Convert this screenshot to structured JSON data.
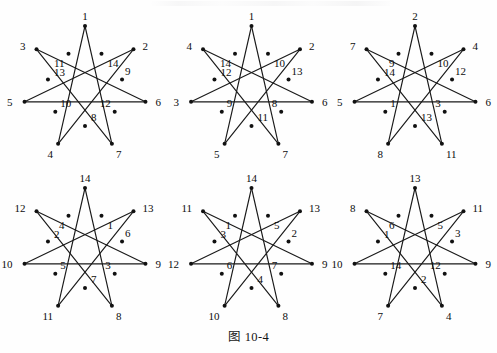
{
  "caption": "图 10-4",
  "figure_type": "seven-pointed-star-polygon-labelings",
  "colors": {
    "ink": "#1a1a1a",
    "node": "#111111",
    "label": "#0d0d0d",
    "page": "#fefefe"
  },
  "geometry": {
    "outer_radius": 62,
    "inner_radius": 38,
    "center_x": 84,
    "center_y": 82,
    "outer_count": 7,
    "inner_count": 7,
    "note": "Outer vertices at angles -90,-38.57,12.86,64.29,115.71,167.14,218.57 degrees; inner vertices midway between adjacent outer vertices."
  },
  "figures": [
    {
      "id": "figure-1",
      "position": "top-left",
      "outer_labels": [
        "1",
        "2",
        "6",
        "7",
        "4",
        "5",
        "3"
      ],
      "inner_labels": [
        "14",
        "9",
        "12",
        "8",
        "10",
        "13",
        "11"
      ]
    },
    {
      "id": "figure-2",
      "position": "top-center",
      "outer_labels": [
        "1",
        "2",
        "6",
        "7",
        "5",
        "3",
        "4"
      ],
      "inner_labels": [
        "10",
        "13",
        "8",
        "11",
        "9",
        "12",
        "14"
      ]
    },
    {
      "id": "figure-3",
      "position": "top-right",
      "outer_labels": [
        "2",
        "4",
        "6",
        "11",
        "8",
        "5",
        "7"
      ],
      "inner_labels": [
        "10",
        "12",
        "3",
        "13",
        "1",
        "14",
        "9"
      ]
    },
    {
      "id": "figure-4",
      "position": "bottom-left",
      "outer_labels": [
        "14",
        "13",
        "9",
        "8",
        "11",
        "10",
        "12"
      ],
      "inner_labels": [
        "1",
        "6",
        "3",
        "7",
        "5",
        "2",
        "4"
      ]
    },
    {
      "id": "figure-5",
      "position": "bottom-center",
      "outer_labels": [
        "14",
        "13",
        "9",
        "8",
        "10",
        "12",
        "11"
      ],
      "inner_labels": [
        "5",
        "2",
        "7",
        "4",
        "6",
        "3",
        "1"
      ]
    },
    {
      "id": "figure-6",
      "position": "bottom-right",
      "outer_labels": [
        "13",
        "11",
        "9",
        "4",
        "7",
        "10",
        "8"
      ],
      "inner_labels": [
        "5",
        "3",
        "12",
        "2",
        "14",
        "1",
        "6"
      ]
    }
  ],
  "label_offsets": {
    "outer": [
      {
        "dx": 0,
        "dy": -6
      },
      {
        "dx": 9,
        "dy": 1
      },
      {
        "dx": 10,
        "dy": 4
      },
      {
        "dx": 4,
        "dy": 14
      },
      {
        "dx": -5,
        "dy": 14
      },
      {
        "dx": -12,
        "dy": 4
      },
      {
        "dx": -11,
        "dy": 1
      }
    ],
    "inner": [
      {
        "dx": 6,
        "dy": 13
      },
      {
        "dx": 3,
        "dy": -5
      },
      {
        "dx": -4,
        "dy": -5
      },
      {
        "dx": 6,
        "dy": -5
      },
      {
        "dx": 5,
        "dy": -5
      },
      {
        "dx": 6,
        "dy": -4
      },
      {
        "dx": -4,
        "dy": 13
      }
    ]
  }
}
